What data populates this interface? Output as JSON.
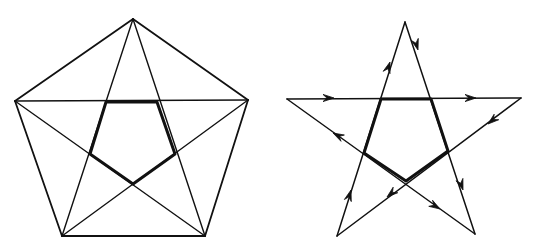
{
  "figures": [
    {
      "id": "pentagon-with-pentagram",
      "description": "Regular pentagon with all diagonals drawn; inner pentagon emphasized",
      "vertices": {
        "top": [
          133,
          19
        ],
        "left": [
          15,
          101
        ],
        "right": [
          248,
          100
        ],
        "bottom_left": [
          62,
          236
        ],
        "bottom_right": [
          205,
          236
        ]
      },
      "inner_pentagon": [
        [
          106,
          102
        ],
        [
          157,
          102
        ],
        [
          175,
          154
        ],
        [
          133,
          184
        ],
        [
          90,
          154
        ]
      ]
    },
    {
      "id": "directed-pentagram",
      "description": "Pentagram drawn as a directed path with arrowheads; inner pentagon emphasized",
      "vertices": {
        "top": [
          405,
          22
        ],
        "left": [
          287,
          99
        ],
        "right": [
          521,
          98
        ],
        "bottom_left": [
          337,
          236
        ],
        "bottom_right": [
          475,
          234
        ]
      },
      "inner_pentagon": [
        [
          381,
          99
        ],
        [
          431,
          99
        ],
        [
          448,
          151
        ],
        [
          406,
          181
        ],
        [
          364,
          153
        ]
      ],
      "arrows": [
        {
          "at": [
            334,
            98
          ],
          "dir": [
            1,
            0
          ]
        },
        {
          "at": [
            476,
            98
          ],
          "dir": [
            1,
            0
          ]
        },
        {
          "at": [
            390,
            62
          ],
          "dir": [
            0.31,
            -0.95
          ]
        },
        {
          "at": [
            418,
            50
          ],
          "dir": [
            0.29,
            0.96
          ]
        },
        {
          "at": [
            488,
            124
          ],
          "dir": [
            -0.77,
            0.64
          ]
        },
        {
          "at": [
            387,
            197
          ],
          "dir": [
            -0.77,
            0.64
          ]
        },
        {
          "at": [
            351,
            190
          ],
          "dir": [
            0.29,
            -0.96
          ]
        },
        {
          "at": [
            463,
            190
          ],
          "dir": [
            0.32,
            0.95
          ]
        },
        {
          "at": [
            333,
            133
          ],
          "dir": [
            -0.88,
            -0.47
          ]
        },
        {
          "at": [
            440,
            209
          ],
          "dir": [
            0.85,
            0.52
          ]
        }
      ]
    }
  ],
  "colors": {
    "stroke": "#111111",
    "background": "#ffffff"
  }
}
